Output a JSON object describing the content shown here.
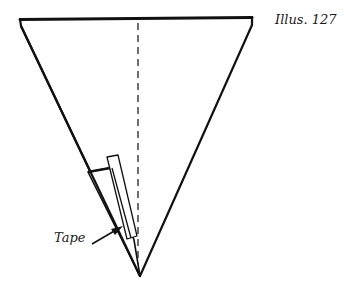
{
  "figure": {
    "caption": "Illus. 127",
    "labels": {
      "tape": "Tape"
    },
    "colors": {
      "stroke": "#111111",
      "background": "#ffffff"
    },
    "shapes": {
      "cone": "inverted triangle with top rim",
      "center_line": "dashed vertical fold line",
      "flap": "folded flap at left edge",
      "tape_strip": "strip of tape along flap",
      "arrow": "pointer from label to tape"
    }
  }
}
